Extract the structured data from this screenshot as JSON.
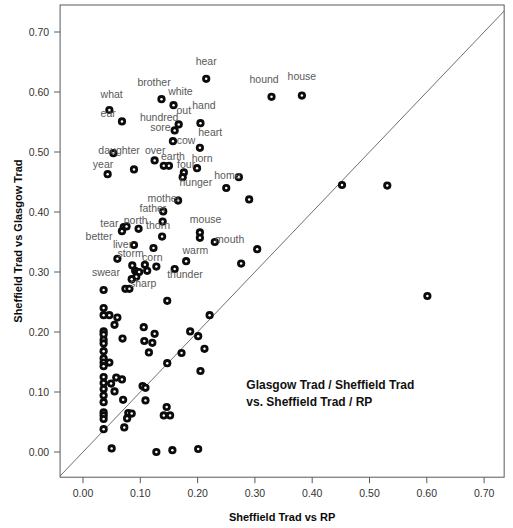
{
  "chart_data": {
    "type": "scatter",
    "title": "",
    "xlabel": "Sheffield Trad vs RP",
    "ylabel": "Sheffield Trad vs Glasgow Trad",
    "annotation": [
      "Glasgow Trad / Sheffield Trad",
      "vs. Sheffield Trad / RP"
    ],
    "xlim": [
      -0.04,
      0.735
    ],
    "ylim": [
      -0.042,
      0.745
    ],
    "xticks": [
      0.0,
      0.1,
      0.2,
      0.3,
      0.4,
      0.5,
      0.6,
      0.7
    ],
    "xtick_labels": [
      "0.00",
      "0.10",
      "0.20",
      "0.30",
      "0.40",
      "0.50",
      "0.60",
      "0.70"
    ],
    "yticks": [
      0.0,
      0.1,
      0.2,
      0.3,
      0.4,
      0.5,
      0.6,
      0.7
    ],
    "ytick_labels": [
      "0.00",
      "0.10",
      "0.20",
      "0.30",
      "0.40",
      "0.50",
      "0.60",
      "0.70"
    ],
    "grid": false,
    "legend": null,
    "reference_line": {
      "type": "identity",
      "slope": 1,
      "intercept": 0
    },
    "marker": {
      "style": "filled-circle-with-white-center",
      "color": "#0b0b0b",
      "size": 6
    },
    "labeled_points": [
      {
        "label": "hear",
        "x": 0.215,
        "y": 0.622,
        "lx": 0.215,
        "ly": 0.652,
        "anchor": "middle"
      },
      {
        "label": "house",
        "x": 0.382,
        "y": 0.594,
        "lx": 0.382,
        "ly": 0.626,
        "anchor": "middle"
      },
      {
        "label": "hound",
        "x": 0.329,
        "y": 0.592,
        "lx": 0.316,
        "ly": 0.622,
        "anchor": "middle"
      },
      {
        "label": "brother",
        "x": 0.137,
        "y": 0.588,
        "lx": 0.124,
        "ly": 0.617,
        "anchor": "middle"
      },
      {
        "label": "white",
        "x": 0.158,
        "y": 0.578,
        "lx": 0.17,
        "ly": 0.601,
        "anchor": "middle"
      },
      {
        "label": "what",
        "x": 0.046,
        "y": 0.57,
        "lx": 0.05,
        "ly": 0.597,
        "anchor": "middle"
      },
      {
        "label": "ear",
        "x": 0.068,
        "y": 0.551,
        "lx": 0.044,
        "ly": 0.565,
        "anchor": "middle"
      },
      {
        "label": "hand",
        "x": 0.205,
        "y": 0.548,
        "lx": 0.211,
        "ly": 0.578,
        "anchor": "middle"
      },
      {
        "label": "out",
        "x": 0.167,
        "y": 0.546,
        "lx": 0.176,
        "ly": 0.57,
        "anchor": "middle"
      },
      {
        "label": "hundred",
        "x": 0.135,
        "y": 0.56,
        "lx": 0.133,
        "ly": 0.558,
        "anchor": "middle"
      },
      {
        "label": "sore",
        "x": 0.16,
        "y": 0.536,
        "lx": 0.135,
        "ly": 0.541,
        "anchor": "middle"
      },
      {
        "label": "heart",
        "x": 0.204,
        "y": 0.507,
        "lx": 0.222,
        "ly": 0.533,
        "anchor": "middle"
      },
      {
        "label": "cow",
        "x": 0.157,
        "y": 0.518,
        "lx": 0.18,
        "ly": 0.52,
        "anchor": "middle"
      },
      {
        "label": "daughter",
        "x": 0.053,
        "y": 0.498,
        "lx": 0.063,
        "ly": 0.503,
        "anchor": "middle"
      },
      {
        "label": "over",
        "x": 0.125,
        "y": 0.486,
        "lx": 0.126,
        "ly": 0.504,
        "anchor": "middle"
      },
      {
        "label": "earth",
        "x": 0.141,
        "y": 0.477,
        "lx": 0.157,
        "ly": 0.493,
        "anchor": "middle"
      },
      {
        "label": "horn",
        "x": 0.199,
        "y": 0.473,
        "lx": 0.208,
        "ly": 0.49,
        "anchor": "middle"
      },
      {
        "label": "four",
        "x": 0.176,
        "y": 0.466,
        "lx": 0.18,
        "ly": 0.48,
        "anchor": "middle"
      },
      {
        "label": "year",
        "x": 0.043,
        "y": 0.463,
        "lx": 0.035,
        "ly": 0.48,
        "anchor": "middle"
      },
      {
        "label": "hunger",
        "x": 0.174,
        "y": 0.458,
        "lx": 0.197,
        "ly": 0.45,
        "anchor": "middle"
      },
      {
        "label": "home",
        "x": 0.25,
        "y": 0.44,
        "lx": 0.252,
        "ly": 0.461,
        "anchor": "middle"
      },
      {
        "label": "mother",
        "x": 0.166,
        "y": 0.419,
        "lx": 0.141,
        "ly": 0.424,
        "anchor": "middle"
      },
      {
        "label": "father",
        "x": 0.14,
        "y": 0.401,
        "lx": 0.122,
        "ly": 0.406,
        "anchor": "middle"
      },
      {
        "label": "north",
        "x": 0.097,
        "y": 0.372,
        "lx": 0.092,
        "ly": 0.386,
        "anchor": "middle"
      },
      {
        "label": "mouse",
        "x": 0.204,
        "y": 0.366,
        "lx": 0.214,
        "ly": 0.388,
        "anchor": "middle"
      },
      {
        "label": "tear",
        "x": 0.071,
        "y": 0.375,
        "lx": 0.046,
        "ly": 0.381,
        "anchor": "middle"
      },
      {
        "label": "thorn",
        "x": 0.138,
        "y": 0.359,
        "lx": 0.131,
        "ly": 0.379,
        "anchor": "middle"
      },
      {
        "label": "mouth",
        "x": 0.23,
        "y": 0.35,
        "lx": 0.256,
        "ly": 0.355,
        "anchor": "middle"
      },
      {
        "label": "better",
        "x": 0.068,
        "y": 0.368,
        "lx": 0.028,
        "ly": 0.36,
        "anchor": "middle"
      },
      {
        "label": "liver",
        "x": 0.089,
        "y": 0.345,
        "lx": 0.069,
        "ly": 0.347,
        "anchor": "middle"
      },
      {
        "label": "warm",
        "x": 0.204,
        "y": 0.357,
        "lx": 0.196,
        "ly": 0.337,
        "anchor": "middle"
      },
      {
        "label": "storm",
        "x": 0.06,
        "y": 0.322,
        "lx": 0.083,
        "ly": 0.332,
        "anchor": "middle"
      },
      {
        "label": "corn",
        "x": 0.108,
        "y": 0.312,
        "lx": 0.121,
        "ly": 0.325,
        "anchor": "middle"
      },
      {
        "label": "swear",
        "x": 0.046,
        "y": 0.3,
        "lx": 0.04,
        "ly": 0.3,
        "anchor": "middle"
      },
      {
        "label": "sharp",
        "x": 0.093,
        "y": 0.292,
        "lx": 0.105,
        "ly": 0.281,
        "anchor": "middle"
      },
      {
        "label": "thunder",
        "x": 0.16,
        "y": 0.305,
        "lx": 0.178,
        "ly": 0.296,
        "anchor": "middle"
      }
    ],
    "points": [
      {
        "x": 0.215,
        "y": 0.622
      },
      {
        "x": 0.382,
        "y": 0.594
      },
      {
        "x": 0.329,
        "y": 0.592
      },
      {
        "x": 0.137,
        "y": 0.588
      },
      {
        "x": 0.158,
        "y": 0.578
      },
      {
        "x": 0.046,
        "y": 0.57
      },
      {
        "x": 0.068,
        "y": 0.551
      },
      {
        "x": 0.205,
        "y": 0.548
      },
      {
        "x": 0.167,
        "y": 0.546
      },
      {
        "x": 0.16,
        "y": 0.536
      },
      {
        "x": 0.157,
        "y": 0.518
      },
      {
        "x": 0.204,
        "y": 0.507
      },
      {
        "x": 0.053,
        "y": 0.498
      },
      {
        "x": 0.125,
        "y": 0.486
      },
      {
        "x": 0.141,
        "y": 0.477
      },
      {
        "x": 0.15,
        "y": 0.477
      },
      {
        "x": 0.199,
        "y": 0.473
      },
      {
        "x": 0.176,
        "y": 0.466
      },
      {
        "x": 0.174,
        "y": 0.458
      },
      {
        "x": 0.043,
        "y": 0.463
      },
      {
        "x": 0.089,
        "y": 0.471
      },
      {
        "x": 0.272,
        "y": 0.458
      },
      {
        "x": 0.25,
        "y": 0.44
      },
      {
        "x": 0.166,
        "y": 0.419
      },
      {
        "x": 0.29,
        "y": 0.421
      },
      {
        "x": 0.14,
        "y": 0.401
      },
      {
        "x": 0.139,
        "y": 0.384
      },
      {
        "x": 0.097,
        "y": 0.372
      },
      {
        "x": 0.204,
        "y": 0.366
      },
      {
        "x": 0.071,
        "y": 0.375
      },
      {
        "x": 0.076,
        "y": 0.376
      },
      {
        "x": 0.138,
        "y": 0.359
      },
      {
        "x": 0.204,
        "y": 0.357
      },
      {
        "x": 0.23,
        "y": 0.35
      },
      {
        "x": 0.068,
        "y": 0.368
      },
      {
        "x": 0.089,
        "y": 0.345
      },
      {
        "x": 0.304,
        "y": 0.338
      },
      {
        "x": 0.123,
        "y": 0.34
      },
      {
        "x": 0.06,
        "y": 0.322
      },
      {
        "x": 0.276,
        "y": 0.314
      },
      {
        "x": 0.108,
        "y": 0.312
      },
      {
        "x": 0.128,
        "y": 0.309
      },
      {
        "x": 0.16,
        "y": 0.305
      },
      {
        "x": 0.086,
        "y": 0.311
      },
      {
        "x": 0.091,
        "y": 0.302
      },
      {
        "x": 0.095,
        "y": 0.3
      },
      {
        "x": 0.098,
        "y": 0.3
      },
      {
        "x": 0.112,
        "y": 0.302
      },
      {
        "x": 0.18,
        "y": 0.318
      },
      {
        "x": 0.093,
        "y": 0.292
      },
      {
        "x": 0.085,
        "y": 0.288
      },
      {
        "x": 0.074,
        "y": 0.272
      },
      {
        "x": 0.081,
        "y": 0.272
      },
      {
        "x": 0.036,
        "y": 0.27
      },
      {
        "x": 0.147,
        "y": 0.252
      },
      {
        "x": 0.221,
        "y": 0.228
      },
      {
        "x": 0.036,
        "y": 0.24
      },
      {
        "x": 0.036,
        "y": 0.228
      },
      {
        "x": 0.046,
        "y": 0.228
      },
      {
        "x": 0.06,
        "y": 0.224
      },
      {
        "x": 0.055,
        "y": 0.212
      },
      {
        "x": 0.187,
        "y": 0.201
      },
      {
        "x": 0.036,
        "y": 0.201
      },
      {
        "x": 0.036,
        "y": 0.196
      },
      {
        "x": 0.106,
        "y": 0.208
      },
      {
        "x": 0.125,
        "y": 0.197
      },
      {
        "x": 0.201,
        "y": 0.193
      },
      {
        "x": 0.036,
        "y": 0.187
      },
      {
        "x": 0.036,
        "y": 0.181
      },
      {
        "x": 0.069,
        "y": 0.189
      },
      {
        "x": 0.107,
        "y": 0.185
      },
      {
        "x": 0.121,
        "y": 0.182
      },
      {
        "x": 0.212,
        "y": 0.172
      },
      {
        "x": 0.036,
        "y": 0.168
      },
      {
        "x": 0.115,
        "y": 0.166
      },
      {
        "x": 0.036,
        "y": 0.156
      },
      {
        "x": 0.172,
        "y": 0.165
      },
      {
        "x": 0.036,
        "y": 0.149
      },
      {
        "x": 0.046,
        "y": 0.149
      },
      {
        "x": 0.036,
        "y": 0.143
      },
      {
        "x": 0.147,
        "y": 0.148
      },
      {
        "x": 0.036,
        "y": 0.125
      },
      {
        "x": 0.058,
        "y": 0.124
      },
      {
        "x": 0.068,
        "y": 0.121
      },
      {
        "x": 0.205,
        "y": 0.135
      },
      {
        "x": 0.036,
        "y": 0.115
      },
      {
        "x": 0.049,
        "y": 0.114
      },
      {
        "x": 0.036,
        "y": 0.105
      },
      {
        "x": 0.055,
        "y": 0.101
      },
      {
        "x": 0.104,
        "y": 0.11
      },
      {
        "x": 0.109,
        "y": 0.107
      },
      {
        "x": 0.036,
        "y": 0.094
      },
      {
        "x": 0.07,
        "y": 0.087
      },
      {
        "x": 0.036,
        "y": 0.083
      },
      {
        "x": 0.109,
        "y": 0.086
      },
      {
        "x": 0.036,
        "y": 0.066
      },
      {
        "x": 0.036,
        "y": 0.061
      },
      {
        "x": 0.079,
        "y": 0.065
      },
      {
        "x": 0.085,
        "y": 0.064
      },
      {
        "x": 0.146,
        "y": 0.075
      },
      {
        "x": 0.036,
        "y": 0.055
      },
      {
        "x": 0.077,
        "y": 0.056
      },
      {
        "x": 0.141,
        "y": 0.061
      },
      {
        "x": 0.152,
        "y": 0.061
      },
      {
        "x": 0.036,
        "y": 0.038
      },
      {
        "x": 0.072,
        "y": 0.041
      },
      {
        "x": 0.05,
        "y": 0.006
      },
      {
        "x": 0.128,
        "y": 0.0
      },
      {
        "x": 0.156,
        "y": 0.003
      },
      {
        "x": 0.201,
        "y": 0.005
      },
      {
        "x": 0.452,
        "y": 0.445
      },
      {
        "x": 0.531,
        "y": 0.444
      },
      {
        "x": 0.601,
        "y": 0.26
      }
    ]
  }
}
